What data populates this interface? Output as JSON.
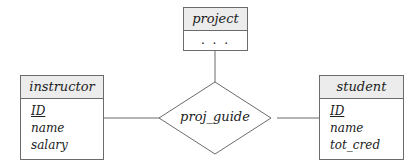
{
  "diagram": {
    "type": "ER diagram",
    "entities": [
      {
        "id": "project",
        "name": "project",
        "attributes": [
          "..."
        ]
      },
      {
        "id": "instructor",
        "name": "instructor",
        "attributes": [
          {
            "name": "ID",
            "primary_key": true
          },
          {
            "name": "name",
            "primary_key": false
          },
          {
            "name": "salary",
            "primary_key": false
          }
        ]
      },
      {
        "id": "student",
        "name": "student",
        "attributes": [
          {
            "name": "ID",
            "primary_key": true
          },
          {
            "name": "name",
            "primary_key": false
          },
          {
            "name": "tot_cred",
            "primary_key": false
          }
        ]
      }
    ],
    "relationship": {
      "name": "proj_guide",
      "connects": [
        "instructor",
        "student",
        "project"
      ]
    }
  },
  "labels": {
    "project": "project",
    "project_dots": ". . .",
    "instructor": "instructor",
    "instructor_attr0": "ID",
    "instructor_attr1": "name",
    "instructor_attr2": "salary",
    "student": "student",
    "student_attr0": "ID",
    "student_attr1": "name",
    "student_attr2": "tot_cred",
    "relationship": "proj_guide"
  },
  "colors": {
    "line": "#6b6b6b",
    "header_bg": "#ececec",
    "text": "#222222"
  }
}
